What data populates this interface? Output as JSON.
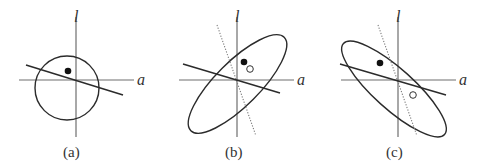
{
  "panels": [
    {
      "id": "a",
      "caption": "(a)",
      "x_axis_label": "a",
      "y_axis_label": "l",
      "contour": "circle",
      "filled_point": true,
      "open_point": false,
      "dotted_line": false
    },
    {
      "id": "b",
      "caption": "(b)",
      "x_axis_label": "a",
      "y_axis_label": "l",
      "contour": "ellipse tilted positive",
      "filled_point": true,
      "open_point": true,
      "dotted_line": true
    },
    {
      "id": "c",
      "caption": "(c)",
      "x_axis_label": "a",
      "y_axis_label": "l",
      "contour": "ellipse tilted negative",
      "filled_point": true,
      "open_point": true,
      "dotted_line": true
    }
  ]
}
